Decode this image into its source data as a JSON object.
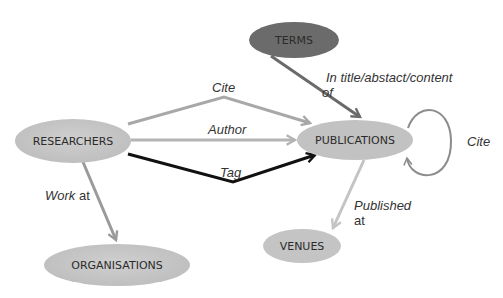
{
  "diagram": {
    "nodes": {
      "terms": {
        "label": "TERMS",
        "fill": "#6b6b6b"
      },
      "researchers": {
        "label": "RESEARCHERS",
        "fill": "#c6c6c6"
      },
      "publications": {
        "label": "PUBLICATIONS",
        "fill": "#c2c2c2"
      },
      "organisations": {
        "label": "ORGANISATIONS",
        "fill": "#cbcbcb"
      },
      "venues": {
        "label": "VENUES",
        "fill": "#c4c4c4"
      }
    },
    "edges": {
      "cite": {
        "label": "Cite",
        "color": "#a8a8a8"
      },
      "author": {
        "label": "Author",
        "color": "#b4b4b4"
      },
      "tag": {
        "label": "Tag",
        "color": "#111111"
      },
      "in_title": {
        "label_line1": "In title/abstact/content",
        "label_line2": "of",
        "color": "#6a6a6a"
      },
      "self_cite": {
        "label": "Cite",
        "color": "#8c8c8c"
      },
      "work_at": {
        "label_italic": "Work",
        "label_plain": " at",
        "color": "#9a9a9a"
      },
      "published_at": {
        "label_line1": "Published",
        "label_line2": "at",
        "color": "#c4c4c4"
      }
    }
  }
}
